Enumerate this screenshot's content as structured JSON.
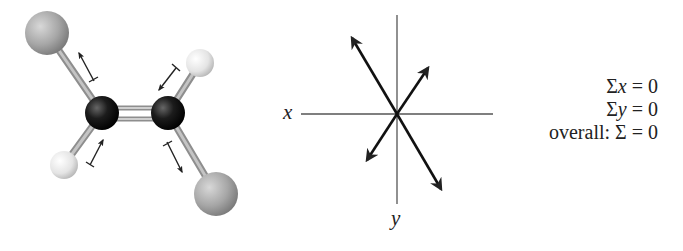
{
  "molecule": {
    "name": "trans-dihaloethene ball-and-stick model",
    "atoms": [
      {
        "id": "X1",
        "type": "halogen",
        "cx": 47,
        "cy": 33,
        "r": 22,
        "color": "#a8a8a8"
      },
      {
        "id": "C1",
        "type": "carbon",
        "cx": 102,
        "cy": 113,
        "r": 17,
        "color": "#1a1a1a"
      },
      {
        "id": "C2",
        "type": "carbon",
        "cx": 168,
        "cy": 113,
        "r": 17,
        "color": "#1a1a1a"
      },
      {
        "id": "H1",
        "type": "hydrogen",
        "cx": 200,
        "cy": 63,
        "r": 14,
        "color": "#e6e6e6"
      },
      {
        "id": "H2",
        "type": "hydrogen",
        "cx": 64,
        "cy": 165,
        "r": 14,
        "color": "#e6e6e6"
      },
      {
        "id": "X2",
        "type": "halogen",
        "cx": 216,
        "cy": 194,
        "r": 22,
        "color": "#a8a8a8"
      }
    ],
    "dipole_arrows": [
      {
        "from": [
          94,
          81
        ],
        "to": [
          78,
          52
        ]
      },
      {
        "from": [
          176,
          68
        ],
        "to": [
          158,
          91
        ]
      },
      {
        "from": [
          90,
          165
        ],
        "to": [
          104,
          139
        ]
      },
      {
        "from": [
          167,
          142
        ],
        "to": [
          183,
          173
        ]
      }
    ]
  },
  "vector_diagram": {
    "origin": [
      397,
      114
    ],
    "x_axis": {
      "label": "x",
      "from": [
        301,
        114
      ],
      "to": [
        493,
        114
      ]
    },
    "y_axis": {
      "label": "y",
      "from": [
        397,
        15
      ],
      "to": [
        397,
        204
      ]
    },
    "vectors": [
      {
        "name": "upper-left",
        "tip": [
          350,
          35
        ]
      },
      {
        "name": "upper-right",
        "tip": [
          430,
          65
        ]
      },
      {
        "name": "lower-left",
        "tip": [
          365,
          163
        ]
      },
      {
        "name": "lower-right",
        "tip": [
          443,
          192
        ]
      }
    ]
  },
  "equations": {
    "sum_x": {
      "prefix": "Σ",
      "var": "x",
      "rest": " = 0"
    },
    "sum_y": {
      "prefix": "Σ",
      "var": "y",
      "rest": " = 0"
    },
    "overall": {
      "prefix": "overall: Σ",
      "var": "",
      "rest": " = 0"
    }
  },
  "colors": {
    "ink": "#222222",
    "carbon": "#1a1a1a",
    "halogen": "#a8a8a8",
    "hydrogen": "#e6e6e6",
    "bond": "#9a9a9a"
  }
}
